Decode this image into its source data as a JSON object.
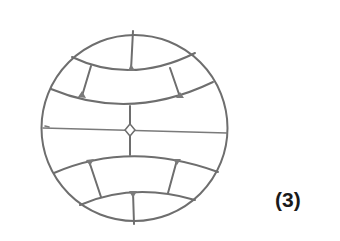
{
  "figure": {
    "label": "(3)"
  },
  "colors": {
    "line": "#7a7a7a",
    "label": "#1a1a1a",
    "background": "#ffffff"
  }
}
